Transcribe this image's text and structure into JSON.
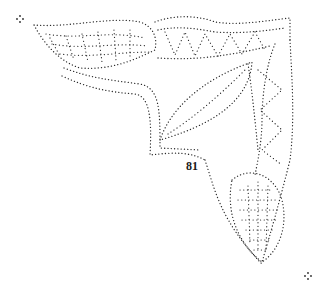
{
  "pattern": {
    "type": "dotted pricking pattern",
    "motif": "corner leaf ornament",
    "number_label": "81",
    "dot_color": "#2a2a2a",
    "background": "#ffffff"
  }
}
